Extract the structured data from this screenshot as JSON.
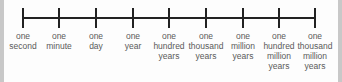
{
  "diagram": {
    "type": "timeline",
    "line_color": "#222222",
    "label_color": "#5a5a5a",
    "ticks": [
      {
        "x": 23,
        "lines": [
          "one",
          "second"
        ]
      },
      {
        "x": 59,
        "lines": [
          "one",
          "minute"
        ]
      },
      {
        "x": 96,
        "lines": [
          "one",
          "day"
        ]
      },
      {
        "x": 133,
        "lines": [
          "one",
          "year"
        ]
      },
      {
        "x": 169,
        "lines": [
          "one",
          "hundred",
          "years"
        ]
      },
      {
        "x": 206,
        "lines": [
          "one",
          "thousand",
          "years"
        ]
      },
      {
        "x": 243,
        "lines": [
          "one",
          "million",
          "years"
        ]
      },
      {
        "x": 279,
        "lines": [
          "one",
          "hundred",
          "million",
          "years"
        ]
      },
      {
        "x": 315,
        "lines": [
          "one",
          "thousand",
          "million",
          "years"
        ]
      }
    ]
  }
}
